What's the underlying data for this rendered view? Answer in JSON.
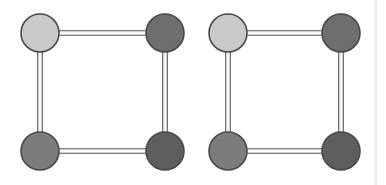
{
  "figure": {
    "width": 386,
    "height": 185,
    "background_color": "#ffffff",
    "edge_style": "double-line",
    "edge_outline_color": "#5a5a5a",
    "edge_fill_color": "#f4f4f4",
    "node_outline_color": "#4a4a4a",
    "node_radius": 19
  },
  "graphs": [
    {
      "id": "graph-left",
      "label": "Left graph",
      "nodes": [
        {
          "id": "L-top-left",
          "label": "top-left",
          "cx": 40,
          "cy": 33,
          "r": 19,
          "color": "#c9c9c9",
          "shade": "light"
        },
        {
          "id": "L-top-right",
          "label": "top-right",
          "cx": 165,
          "cy": 33,
          "r": 19,
          "color": "#6e6e6e",
          "shade": "dark"
        },
        {
          "id": "L-bottom-left",
          "label": "bottom-left",
          "cx": 40,
          "cy": 151,
          "r": 19,
          "color": "#7c7c7c",
          "shade": "medium-dark"
        },
        {
          "id": "L-bottom-right",
          "label": "bottom-right",
          "cx": 165,
          "cy": 151,
          "r": 19,
          "color": "#5e5e5e",
          "shade": "darkest"
        }
      ],
      "edges": [
        {
          "id": "L-e1",
          "from": "L-top-left",
          "to": "L-top-right",
          "orientation": "horizontal"
        },
        {
          "id": "L-e2",
          "from": "L-top-left",
          "to": "L-bottom-left",
          "orientation": "vertical"
        },
        {
          "id": "L-e3",
          "from": "L-top-right",
          "to": "L-bottom-right",
          "orientation": "vertical"
        },
        {
          "id": "L-e4",
          "from": "L-bottom-left",
          "to": "L-bottom-right",
          "orientation": "horizontal"
        }
      ]
    },
    {
      "id": "graph-right",
      "label": "Right graph",
      "nodes": [
        {
          "id": "R-top-left",
          "label": "top-left",
          "cx": 228,
          "cy": 33,
          "r": 19,
          "color": "#c9c9c9",
          "shade": "light"
        },
        {
          "id": "R-top-right",
          "label": "top-right",
          "cx": 341,
          "cy": 33,
          "r": 19,
          "color": "#6e6e6e",
          "shade": "dark"
        },
        {
          "id": "R-bottom-left",
          "label": "bottom-left",
          "cx": 228,
          "cy": 151,
          "r": 19,
          "color": "#7c7c7c",
          "shade": "medium-dark"
        },
        {
          "id": "R-bottom-right",
          "label": "bottom-right",
          "cx": 341,
          "cy": 151,
          "r": 19,
          "color": "#5e5e5e",
          "shade": "darkest"
        }
      ],
      "edges": [
        {
          "id": "R-e1",
          "from": "R-top-left",
          "to": "R-top-right",
          "orientation": "horizontal"
        },
        {
          "id": "R-e2",
          "from": "R-top-left",
          "to": "R-bottom-left",
          "orientation": "vertical"
        },
        {
          "id": "R-e3",
          "from": "R-top-right",
          "to": "R-bottom-right",
          "orientation": "vertical"
        },
        {
          "id": "R-e4",
          "from": "R-bottom-left",
          "to": "R-bottom-right",
          "orientation": "horizontal"
        }
      ]
    }
  ],
  "artifacts": [
    {
      "id": "right-margin-line",
      "label": "right margin line",
      "x": 374,
      "y": 0,
      "width": 3,
      "height": 185,
      "color": "#efefef"
    }
  ]
}
